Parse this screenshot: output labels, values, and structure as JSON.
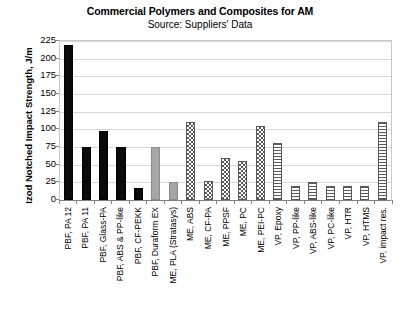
{
  "header": {
    "title": "Commercial Polymers and Composites for AM",
    "subtitle": "Source: Suppliers' Data"
  },
  "axes": {
    "ylabel": "Izod Notched Impact Strength, J/m",
    "xlabel": "",
    "yticks": [
      "225",
      "200",
      "175",
      "150",
      "125",
      "100",
      "75",
      "50",
      "25",
      "0"
    ]
  },
  "colors": {
    "solid_black": "#0a0a0a",
    "solid_gray": "#a6a6a6",
    "pattern_dark": "#5a5a5a",
    "gridline": "#d9d9d9",
    "axis": "#808080",
    "text": "#000000",
    "background": "#ffffff"
  },
  "chart_data": {
    "type": "bar",
    "title": "Commercial Polymers and Composites for AM",
    "subtitle": "Source: Suppliers' Data",
    "xlabel": "",
    "ylabel": "Izod Notched Impact Strength, J/m",
    "ylim": [
      0,
      225
    ],
    "ytick_step": 25,
    "grid": true,
    "legend": false,
    "categories": [
      "PBF, PA 12",
      "PBF, PA 11",
      "PBF, Glass-PA",
      "PBF, ABS & PP-like",
      "PBF, CF-PEKK",
      "PBF, Duraform EX",
      "ME, PLA (Stratasys)",
      "ME, ABS",
      "ME, CF-PA",
      "ME, PPSF",
      "ME, PC",
      "ME, PEI-PC",
      "VP, Epoxy",
      "VP, PP-like",
      "VP, ABS-like",
      "VP, PC-like",
      "VP, HTR",
      "VP, HTMS",
      "VP, impact res."
    ],
    "values": [
      220,
      75,
      97,
      75,
      17,
      75,
      25,
      110,
      27,
      60,
      55,
      105,
      80,
      20,
      25,
      20,
      20,
      20,
      110
    ],
    "fills": [
      "solid-black",
      "solid-black",
      "solid-black",
      "solid-black",
      "solid-black",
      "solid-gray",
      "solid-gray",
      "checker",
      "checker",
      "checker",
      "checker",
      "checker",
      "hlines",
      "hlines",
      "hlines",
      "hlines",
      "hlines",
      "hlines",
      "hlines"
    ]
  }
}
